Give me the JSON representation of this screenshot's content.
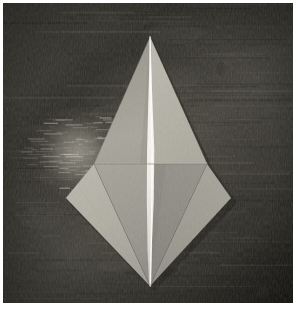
{
  "scene": {
    "kind": "photograph",
    "subject": "origami-paper-fold",
    "orientation": "portrait",
    "canvas": {
      "width": 303,
      "height": 314
    },
    "photo_inset": {
      "x": 3,
      "y": 3,
      "width": 290,
      "height": 300
    }
  },
  "colors": {
    "page_background": "#ffffff",
    "surface_dark": "#34322c",
    "surface_mid": "#4a4840",
    "surface_light": "#6d6a60",
    "surface_highlight": "#b9b5a8",
    "surface_shadow": "#23221d",
    "paper_bright": "#fdfdf8",
    "paper_light": "#b9b6ab",
    "paper_mid": "#a7a49a",
    "paper_mid_dark": "#9a978d",
    "paper_dark": "#8e8b82",
    "paper_darkest": "#82807a",
    "crease_line": "#6f6d66",
    "crease_light": "#c8c5ba"
  },
  "geometry": {
    "top_apex": {
      "x": 150,
      "y": 37
    },
    "bottom_apex": {
      "x": 150,
      "y": 286
    },
    "left_wing_tip": {
      "x": 66,
      "y": 198
    },
    "right_wing_tip": {
      "x": 231,
      "y": 198
    },
    "left_shoulder": {
      "x": 94,
      "y": 164
    },
    "right_shoulder": {
      "x": 207,
      "y": 164
    },
    "horizontal_fold_y": 164,
    "center_axis_x": 150,
    "center_strip_max_width": 7
  },
  "background": {
    "description": "dark gray-brown horizontally streaked slate surface",
    "highlight_region": {
      "cx": 78,
      "cy": 152,
      "rx": 52,
      "ry": 34
    },
    "streak_count": 150
  },
  "facets": [
    {
      "name": "upper-left-panel",
      "tone": "#a5a299"
    },
    {
      "name": "upper-right-panel",
      "tone": "#b2afa4"
    },
    {
      "name": "center-white-sliver",
      "tone": "#fdfdf8"
    },
    {
      "name": "lower-left-wing",
      "tone": "#b4b1a6"
    },
    {
      "name": "lower-left-inner",
      "tone": "#9b988e"
    },
    {
      "name": "lower-right-wing",
      "tone": "#a09d93"
    },
    {
      "name": "lower-right-inner",
      "tone": "#8f8c83"
    }
  ],
  "creases": [
    {
      "name": "center-vertical-crease",
      "from": "top_apex",
      "to": "bottom_apex"
    },
    {
      "name": "horizontal-mid-fold",
      "from": "left_shoulder",
      "to": "right_shoulder"
    },
    {
      "name": "left-diagonal-crease",
      "from": "left_wing_tip",
      "to": "bottom_apex"
    },
    {
      "name": "right-diagonal-crease",
      "from": "right_wing_tip",
      "to": "bottom_apex"
    }
  ]
}
